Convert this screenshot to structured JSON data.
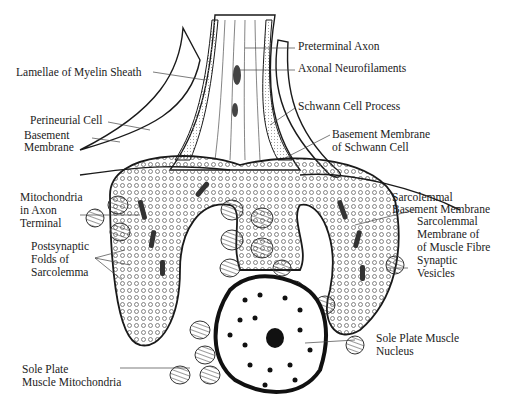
{
  "diagram": {
    "colors": {
      "ink": "#1a1a1a",
      "shade": "#c8c8c8",
      "background": "#ffffff"
    },
    "labels": {
      "preterminal_axon": "Preterminal Axon",
      "lamellae_myelin": "Lamellae of Myelin Sheath",
      "axonal_neurofilaments": "Axonal Neurofilaments",
      "perineurial_cell": "Perineurial Cell",
      "schwann_cell_process": "Schwann Cell Process",
      "basement_membrane_l1": "Basement",
      "basement_membrane_l2": "Membrane",
      "bm_schwann_l1": "Basement Membrane",
      "bm_schwann_l2": "of Schwann Cell",
      "mito_axon_l1": "Mitochondria",
      "mito_axon_l2": "in Axon",
      "mito_axon_l3": "Terminal",
      "sarco_bm_l1": "Sarcolemmal",
      "sarco_bm_l2": "Basement Membrane",
      "sarco_mem_l1": "Sarcolemmal",
      "sarco_mem_l2": "Membrane of",
      "sarco_mem_l3": "of Muscle Fibre",
      "synaptic_l1": "Synaptic",
      "synaptic_l2": "Vesicles",
      "postsyn_l1": "Postsynaptic",
      "postsyn_l2": "Folds of",
      "postsyn_l3": "Sarcolemma",
      "nucleus_l1": "Sole Plate Muscle",
      "nucleus_l2": "Nucleus",
      "sole_mito_l1": "Sole Plate",
      "sole_mito_l2": "Muscle Mitochondria"
    }
  }
}
